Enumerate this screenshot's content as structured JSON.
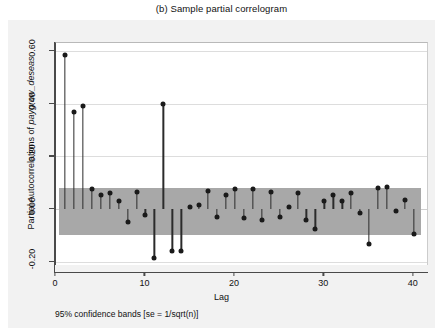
{
  "figure": {
    "title": "(b)  Sample partial correlogram",
    "footnote": "95% confidence bands [se = 1/sqrt(n)]"
  },
  "chart_data": {
    "type": "bar",
    "title": "(b)  Sample partial correlogram",
    "xlabel": "Lag",
    "ylabel_prefix": "Partial Autocorrelations of ",
    "ylabel_italic": "paygrow_deseas",
    "ylabel": "Partial Autocorrelations of paygrow_deseas",
    "xlim": [
      0,
      41.7
    ],
    "ylim": [
      -0.215,
      0.63
    ],
    "xticks": [
      0,
      10,
      20,
      30,
      40
    ],
    "xtick_labels": [
      "0",
      "10",
      "20",
      "30",
      "40"
    ],
    "yticks": [
      -0.2,
      0.0,
      0.2,
      0.4,
      0.6
    ],
    "ytick_labels": [
      "-0.20",
      "0.00",
      "0.20",
      "0.40",
      "0.60"
    ],
    "grid": true,
    "legend": "none",
    "confidence_band": {
      "label": "95% confidence bands [se = 1/sqrt(n)]",
      "upper": 0.081,
      "lower": -0.096,
      "color": "#a8a8a8",
      "x_start": 0.3,
      "x_end": 40.8
    },
    "marker_color": "#1a1a1a",
    "stem_color": "#2b2b2b",
    "categories": [
      1,
      2,
      3,
      4,
      5,
      6,
      7,
      8,
      9,
      10,
      11,
      12,
      13,
      14,
      15,
      16,
      17,
      18,
      19,
      20,
      21,
      22,
      23,
      24,
      25,
      26,
      27,
      28,
      29,
      30,
      31,
      32,
      33,
      34,
      35,
      36,
      37,
      38,
      39,
      40
    ],
    "values": [
      0.585,
      0.368,
      0.39,
      0.075,
      0.055,
      0.06,
      0.03,
      -0.05,
      0.065,
      -0.02,
      -0.185,
      0.398,
      -0.16,
      -0.16,
      0.01,
      0.015,
      0.07,
      -0.03,
      0.055,
      0.075,
      -0.035,
      0.075,
      -0.04,
      0.065,
      -0.03,
      0.01,
      0.06,
      -0.04,
      -0.075,
      0.03,
      0.055,
      0.03,
      0.06,
      -0.015,
      -0.13,
      0.08,
      0.085,
      -0.005,
      0.035,
      -0.095
    ]
  }
}
